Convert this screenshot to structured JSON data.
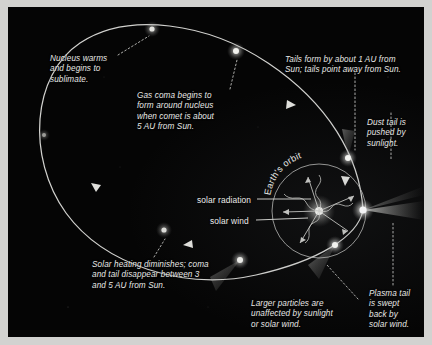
{
  "figure": {
    "background_color": "#050505",
    "frame_color": "#d2d2d0",
    "orbit_color": "#e6e6e4",
    "text_color": "#e8e8e6"
  },
  "annotations": {
    "nucleus_warms": "Nucleus warms\nand begins to\nsublimate.",
    "gas_coma": "Gas coma begins to\nform around nucleus\nwhen comet is about\n5 AU from Sun.",
    "tails_form": "Tails form by about 1 AU from\nSun; tails point away from Sun.",
    "dust_tail": "Dust tail is\npushed by\nsunlight.",
    "solar_heating": "Solar heating diminishes; coma\nand tail disappear between 3\nand 5 AU from Sun.",
    "larger_particles": "Larger particles are\nunaffected by sunlight\nor solar wind.",
    "plasma_tail": "Plasma tail\nis swept\nback by\nsolar wind."
  },
  "labels": {
    "solar_radiation": "solar radiation",
    "solar_wind": "solar wind",
    "earths_orbit": "Earth's orbit"
  },
  "objects": {
    "sun": {
      "cx": 311,
      "cy": 204,
      "r": 5
    },
    "earth_orbit_circle": {
      "cx": 311,
      "cy": 204,
      "r": 47
    },
    "comet_nodes": [
      {
        "name": "far-left-aphelion",
        "cx": 36,
        "cy": 128,
        "r": 3,
        "brightness": "dim"
      },
      {
        "name": "upper-left-sublimate",
        "cx": 144,
        "cy": 22,
        "r": 4,
        "brightness": "medium"
      },
      {
        "name": "upper-mid-gas-coma",
        "cx": 228,
        "cy": 44,
        "r": 5,
        "brightness": "bright"
      },
      {
        "name": "inbound-upper-right",
        "cx": 340,
        "cy": 151,
        "r": 5,
        "brightness": "bright"
      },
      {
        "name": "perihelion",
        "cx": 355,
        "cy": 203,
        "r": 6,
        "brightness": "brightest"
      },
      {
        "name": "outbound-lower",
        "cx": 327,
        "cy": 238,
        "r": 5,
        "brightness": "bright"
      },
      {
        "name": "outbound-left",
        "cx": 232,
        "cy": 253,
        "r": 5,
        "brightness": "medium"
      },
      {
        "name": "fading-lower-left",
        "cx": 156,
        "cy": 223,
        "r": 4,
        "brightness": "medium"
      }
    ],
    "direction_arrows": [
      {
        "name": "arrow-inbound-upper-right",
        "x": 279,
        "y": 93
      },
      {
        "name": "arrow-outbound-lower-left",
        "x": 185,
        "y": 238
      },
      {
        "name": "arrow-left-descending",
        "x": 90,
        "y": 182
      }
    ]
  }
}
